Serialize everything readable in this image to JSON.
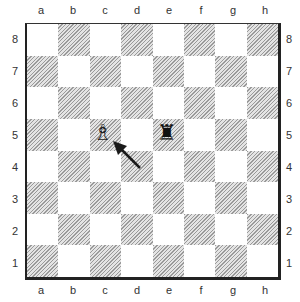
{
  "diagram": {
    "files": [
      "a",
      "b",
      "c",
      "d",
      "e",
      "f",
      "g",
      "h"
    ],
    "ranks": [
      "8",
      "7",
      "6",
      "5",
      "4",
      "3",
      "2",
      "1"
    ],
    "pieces": [
      {
        "square": "c5",
        "piece": "white-bishop",
        "glyph": "♗"
      },
      {
        "square": "e5",
        "piece": "black-rook",
        "glyph": "♜"
      }
    ],
    "arrow": {
      "from": "d4",
      "to": "c5",
      "color": "#1a1a1a"
    },
    "colors": {
      "dark_square": "#9a9a9a",
      "light_square": "#ffffff",
      "border": "#222222"
    }
  }
}
